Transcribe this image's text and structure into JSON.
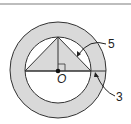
{
  "diagram": {
    "type": "geometry",
    "center_label": "O",
    "labels": {
      "inner_label": "5",
      "outer_label": "3"
    },
    "colors": {
      "shade": "#d9d9d9",
      "stroke": "#333333",
      "background": "#ffffff"
    }
  }
}
